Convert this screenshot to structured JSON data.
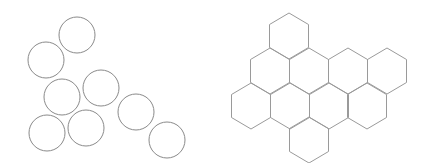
{
  "figure": {
    "width": 432,
    "height": 163,
    "background": "#ffffff",
    "stroke_color": "#8a8a8a"
  },
  "circles_panel": {
    "label": "",
    "radius": 18,
    "circles": [
      {
        "cx": 77,
        "cy": 35
      },
      {
        "cx": 46,
        "cy": 60
      },
      {
        "cx": 62,
        "cy": 97
      },
      {
        "cx": 101,
        "cy": 88
      },
      {
        "cx": 47,
        "cy": 133
      },
      {
        "cx": 86,
        "cy": 128
      },
      {
        "cx": 136,
        "cy": 112
      },
      {
        "cx": 167,
        "cy": 140
      }
    ]
  },
  "hexagon_panel": {
    "label": "",
    "half_width": 19.5,
    "half_height": 23,
    "hexagons": [
      {
        "cx": 289,
        "cy": 36
      },
      {
        "cx": 270,
        "cy": 71
      },
      {
        "cx": 309,
        "cy": 71
      },
      {
        "cx": 348,
        "cy": 71
      },
      {
        "cx": 387,
        "cy": 71
      },
      {
        "cx": 251,
        "cy": 106
      },
      {
        "cx": 290,
        "cy": 106
      },
      {
        "cx": 329,
        "cy": 106
      },
      {
        "cx": 367,
        "cy": 106
      },
      {
        "cx": 309,
        "cy": 140
      }
    ]
  }
}
